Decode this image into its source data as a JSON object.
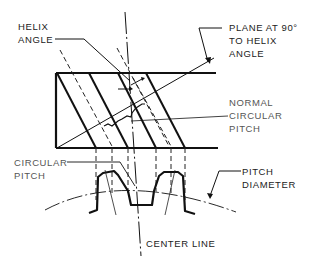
{
  "diagram": {
    "labels": {
      "helix_angle": [
        "HELIX",
        "ANGLE"
      ],
      "plane": [
        "PLANE AT 90°",
        "TO HELIX",
        "ANGLE"
      ],
      "normal_circular_pitch": [
        "NORMAL",
        "CIRCULAR",
        "PITCH"
      ],
      "circular_pitch": [
        "CIRCULAR",
        "PITCH"
      ],
      "pitch_diameter": [
        "PITCH",
        "DIAMETER"
      ],
      "center_line": "CENTER LINE"
    },
    "colors": {
      "line": "#111111",
      "text": "#222222",
      "background": "#ffffff"
    }
  }
}
